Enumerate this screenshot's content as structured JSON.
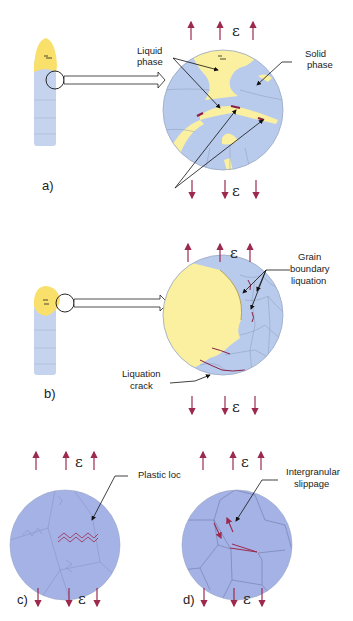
{
  "figure": {
    "colors": {
      "grain_fill": "#b9cbec",
      "grain_dark_fill": "#a5b2e6",
      "liquid_fill": "#faf0a0",
      "strain_arrow": "#9c2a4d",
      "crack": "#8c1f45",
      "annotation_line": "#111111",
      "grain_boundary": "#8d9bb8"
    },
    "strain_symbol": "ε",
    "panels": [
      {
        "id": "a",
        "label": "a)",
        "annotations": [
          "Liquid",
          "phase",
          "Solid",
          "phase"
        ]
      },
      {
        "id": "b",
        "label": "b)",
        "annotations": [
          "Grain",
          "boundary",
          "liquation",
          "Liquation",
          "crack"
        ]
      },
      {
        "id": "c",
        "label": "c)",
        "annotations": [
          "Plastic loc"
        ]
      },
      {
        "id": "d",
        "label": "d)",
        "annotations": [
          "Intergranular",
          "slippage"
        ]
      }
    ]
  }
}
